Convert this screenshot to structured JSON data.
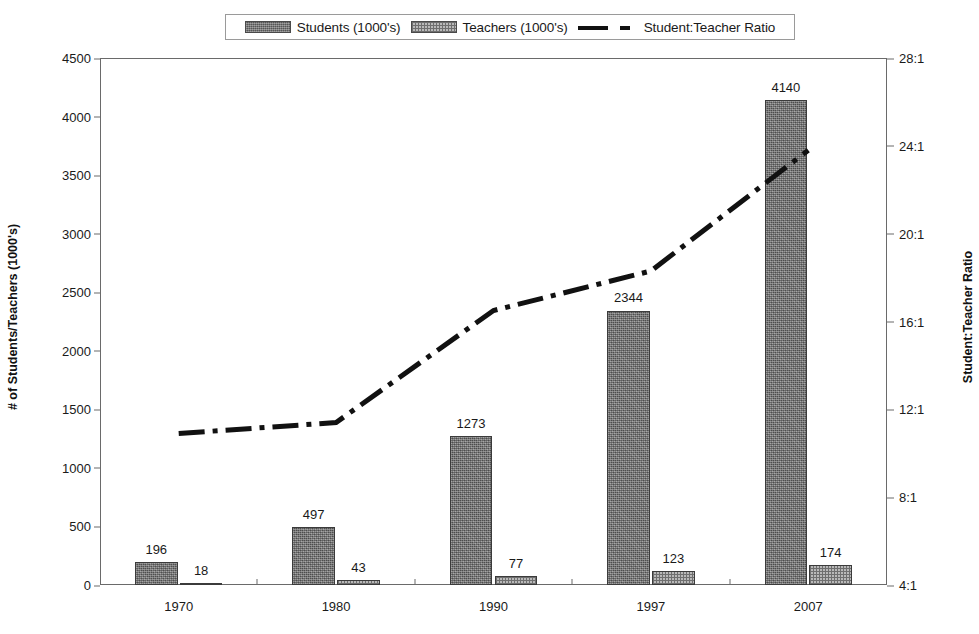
{
  "legend": {
    "items": [
      {
        "label": "Students (1000's)",
        "icon": "swatch-students",
        "color": "#6d6d6d"
      },
      {
        "label": "Teachers (1000's)",
        "icon": "swatch-teachers",
        "color": "#b9b9b9"
      },
      {
        "label": "Student:Teacher Ratio",
        "icon": "dash-dot-line",
        "color": "#111111"
      }
    ]
  },
  "axes": {
    "left_title": "# of Students/Teachers (1000's)",
    "right_title": "Student:Teacher Ratio",
    "left_ticks": [
      "4500",
      "4000",
      "3500",
      "3000",
      "2500",
      "2000",
      "1500",
      "1000",
      "500",
      "0"
    ],
    "right_ticks": [
      "28:1",
      "24:1",
      "20:1",
      "16:1",
      "12:1",
      "8:1",
      "4:1"
    ],
    "x_ticks": [
      "1970",
      "1980",
      "1990",
      "1997",
      "2007"
    ]
  },
  "chart_data": {
    "type": "bar",
    "title": "",
    "xlabel": "",
    "ylabel": "# of Students/Teachers (1000's)",
    "y2label": "Student:Teacher Ratio",
    "categories": [
      "1970",
      "1980",
      "1990",
      "1997",
      "2007"
    ],
    "ylim": [
      0,
      4500
    ],
    "ytick_step": 500,
    "y2lim": [
      4,
      28
    ],
    "y2tick_step": 4,
    "grid": false,
    "legend_position": "top-center",
    "series": [
      {
        "name": "Students (1000's)",
        "kind": "bar",
        "axis": "left",
        "color": "#6d6d6d",
        "pattern": "noise",
        "values": [
          196,
          497,
          1273,
          2344,
          4140
        ],
        "labels": [
          "196",
          "497",
          "1273",
          "2344",
          "4140"
        ]
      },
      {
        "name": "Teachers (1000's)",
        "kind": "bar",
        "axis": "left",
        "color": "#b9b9b9",
        "pattern": "checker",
        "values": [
          18,
          43,
          77,
          123,
          174
        ],
        "labels": [
          "18",
          "43",
          "77",
          "123",
          "174"
        ]
      },
      {
        "name": "Student:Teacher Ratio",
        "kind": "line",
        "axis": "right",
        "color": "#111111",
        "linestyle": "dash-dot",
        "values": [
          10.9,
          11.4,
          16.5,
          18.3,
          23.8
        ]
      }
    ]
  }
}
